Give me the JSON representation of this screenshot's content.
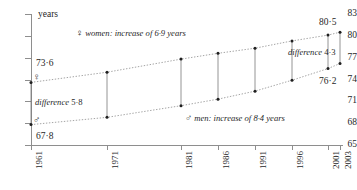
{
  "chart_data": {
    "type": "line",
    "title": "",
    "xlabel": "",
    "ylabel": "years",
    "ylim": [
      65,
      83
    ],
    "yticks": [
      65,
      68,
      71,
      74,
      77,
      80,
      83
    ],
    "categories": [
      "1961",
      "1971",
      "1981",
      "1986",
      "1991",
      "1996",
      "2001",
      "2003"
    ],
    "grid": false,
    "legend_position": "inline",
    "series": [
      {
        "name": "women",
        "symbol": "♀",
        "values": [
          73.6,
          75.0,
          76.8,
          77.6,
          78.3,
          79.3,
          80.1,
          80.5
        ]
      },
      {
        "name": "men",
        "symbol": "♂",
        "values": [
          67.8,
          68.8,
          70.4,
          71.3,
          72.4,
          73.9,
          75.5,
          76.2
        ]
      }
    ],
    "annotations": [
      {
        "text_prefix": "difference ",
        "value": "5·8"
      },
      {
        "text_prefix": "difference ",
        "value": "4·3"
      }
    ],
    "point_labels": {
      "women_start": "73·6",
      "women_end": "80·5",
      "men_start": "67·8",
      "men_end": "76·2"
    },
    "legend_entries": [
      {
        "symbol": "♀",
        "text": "women: increase of 6·9 years"
      },
      {
        "symbol": "♂",
        "text": "men: increase of 8·4 years"
      }
    ],
    "colors": {
      "axis": "#8e8e8e",
      "line": "#9a9a9a",
      "marker": "#1f1f1f",
      "connector": "#7a7a7a",
      "text": "#1f1f1f",
      "background": "#ffffff"
    }
  },
  "axis": {
    "y_title": "years",
    "y_labels": [
      "83",
      "80",
      "77",
      "74",
      "71",
      "68",
      "65"
    ],
    "x_labels": [
      "1961",
      "1971",
      "1981",
      "1986",
      "1991",
      "1996",
      "2001",
      "2003"
    ]
  },
  "labels": {
    "women_start": "73·6",
    "women_end": "80·5",
    "men_start": "67·8",
    "men_end": "76·2",
    "difference_left_prefix": "difference ",
    "difference_left_value": "5·8",
    "difference_right_prefix": "difference ",
    "difference_right_value": "4·3",
    "women_symbol": "♀",
    "men_symbol": "♂",
    "women_legend": "women: increase of 6·9 years",
    "men_legend": "men: increase of 8·4 years"
  }
}
